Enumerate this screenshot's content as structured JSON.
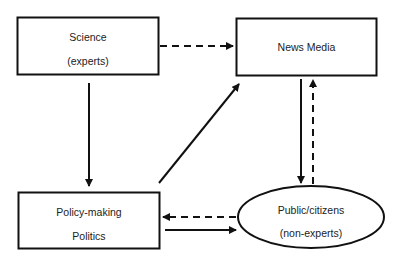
{
  "diagram": {
    "nodes": [
      {
        "id": "science",
        "shape": "rectangle",
        "lines": [
          "Science",
          "(experts)"
        ]
      },
      {
        "id": "news_media",
        "shape": "rectangle",
        "lines": [
          "News Media"
        ]
      },
      {
        "id": "policy",
        "shape": "rectangle",
        "lines": [
          "Policy-making",
          "Politics"
        ]
      },
      {
        "id": "public",
        "shape": "ellipse",
        "lines": [
          "Public/citizens",
          "(non-experts)"
        ]
      }
    ],
    "edges": [
      {
        "from": "science",
        "to": "news_media",
        "style": "dashed"
      },
      {
        "from": "science",
        "to": "policy",
        "style": "solid"
      },
      {
        "from": "policy",
        "to": "news_media",
        "style": "solid"
      },
      {
        "from": "news_media",
        "to": "public",
        "style": "solid"
      },
      {
        "from": "public",
        "to": "news_media",
        "style": "dashed"
      },
      {
        "from": "public",
        "to": "policy",
        "style": "dashed"
      },
      {
        "from": "policy",
        "to": "public",
        "style": "solid"
      }
    ],
    "colors": {
      "stroke": "#111111",
      "text": "#222222",
      "background": "#ffffff"
    }
  }
}
